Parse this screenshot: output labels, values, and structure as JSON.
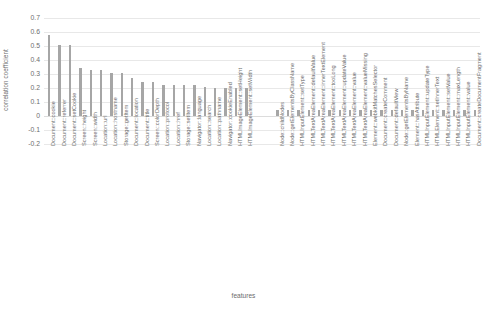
{
  "chart_data": {
    "type": "bar",
    "title": "",
    "xlabel": "features",
    "ylabel": "correlation coefficient",
    "ylim": [
      -0.2,
      0.7
    ],
    "ytick_labels": [
      "0.7",
      "0.6",
      "0.5",
      "0.4",
      "0.3",
      "0.2",
      "0.1",
      "0",
      "-0.1",
      "-0.2"
    ],
    "ytick_values": [
      0.7,
      0.6,
      0.5,
      0.4,
      0.3,
      0.2,
      0.1,
      0,
      -0.1,
      -0.2
    ],
    "grid": true,
    "legend": false,
    "bar_color": "#a6a6a6",
    "categories": [
      "Document::cookie",
      "Document::referrer",
      "Document::setCookie",
      "Screen::height",
      "Screen::width",
      "Location::url",
      "Location::hostname",
      "Storage::getItem",
      "Document::location",
      "Document::title",
      "Screen::colorDepth",
      "Location::protocol",
      "Location::href",
      "Storage::setItem",
      "Navigator::language",
      "Location::search",
      "Location::pathname",
      "Navigator::cookieEnabled",
      "HTMLImageElement::setHeight",
      "HTMLImageElement::setWidth",
      "",
      "",
      "Node::childNodes",
      "Node::getElementsByClassName",
      "HTMLInputElement::setType",
      "HTMLTextAreaElement::defaultValue",
      "HTMLTextAreaElement::innerTextElement",
      "HTMLTextAreaElement::tooLong",
      "HTMLTextAreaElement::updateValue",
      "HTMLTextAreaElement::value",
      "HTMLTextAreaElement::valueMissing",
      "Element::webkitMatchesSelector",
      "Document::createComment",
      "Document::defaultView",
      "Node::getElementsByName",
      "Element::hasAttribute",
      "HTMLInputElement::updateType",
      "HTMLElement::setInnerText",
      "HTMLInputElement::setValue",
      "HTMLInputElement::maxLength",
      "HTMLInputElement::value",
      "Document::createDocumentFragment"
    ],
    "values": [
      0.58,
      0.51,
      0.51,
      0.34,
      0.33,
      0.33,
      0.31,
      0.31,
      0.27,
      0.24,
      0.24,
      0.22,
      0.22,
      0.22,
      0.22,
      0.21,
      0.2,
      0.2,
      0.2,
      0.2,
      null,
      null,
      0.045,
      0.045,
      0.045,
      0.045,
      0.045,
      0.045,
      0.045,
      0.045,
      0.045,
      0.045,
      0.045,
      0.045,
      0.045,
      0.045,
      0.045,
      0.045,
      0.045,
      0.045,
      0.045,
      0.045
    ]
  }
}
